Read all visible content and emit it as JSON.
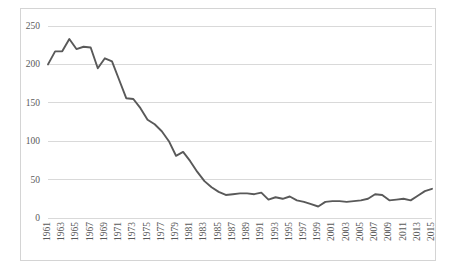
{
  "chart_data": {
    "type": "line",
    "title": "",
    "subtitle": "",
    "xlabel": "",
    "ylabel": "",
    "xlim": [
      1961,
      2015
    ],
    "ylim": [
      0,
      250
    ],
    "ytick_values": [
      250,
      200,
      150,
      100,
      50,
      0
    ],
    "ytick_labels": [
      "250",
      "200",
      "150",
      "100",
      "50",
      "0"
    ],
    "xtick_labels": [
      "1961",
      "1963",
      "1965",
      "1967",
      "1969",
      "1971",
      "1973",
      "1975",
      "1977",
      "1979",
      "1981",
      "1983",
      "1985",
      "1987",
      "1989",
      "1991",
      "1993",
      "1995",
      "1997",
      "1999",
      "2001",
      "2003",
      "2005",
      "2007",
      "2009",
      "2011",
      "2013",
      "2015"
    ],
    "grid": "horizontal",
    "legend": "none",
    "line_color": "#595959",
    "grid_color": "#d9d9d9",
    "axis_text_color": "#595959",
    "border_color": "#d4d4d4",
    "x": [
      1961,
      1962,
      1963,
      1964,
      1965,
      1966,
      1967,
      1968,
      1969,
      1970,
      1971,
      1972,
      1973,
      1974,
      1975,
      1976,
      1977,
      1978,
      1979,
      1980,
      1981,
      1982,
      1983,
      1984,
      1985,
      1986,
      1987,
      1988,
      1989,
      1990,
      1991,
      1992,
      1993,
      1994,
      1995,
      1996,
      1997,
      1998,
      1999,
      2000,
      2001,
      2002,
      2003,
      2004,
      2005,
      2006,
      2007,
      2008,
      2009,
      2010,
      2011,
      2012,
      2013,
      2014,
      2015
    ],
    "values": [
      200,
      217,
      217,
      233,
      220,
      223,
      222,
      195,
      208,
      204,
      180,
      156,
      155,
      143,
      128,
      122,
      113,
      100,
      81,
      86,
      74,
      60,
      48,
      40,
      34,
      30,
      31,
      32,
      32,
      31,
      33,
      24,
      27,
      25,
      28,
      23,
      21,
      18,
      15,
      21,
      22,
      22,
      21,
      22,
      23,
      25,
      31,
      30,
      23,
      24,
      25,
      23,
      29,
      35,
      38
    ],
    "series": [
      {
        "name": "Series 1",
        "values": [
          200,
          217,
          217,
          233,
          220,
          223,
          222,
          195,
          208,
          204,
          180,
          156,
          155,
          143,
          128,
          122,
          113,
          100,
          81,
          86,
          74,
          60,
          48,
          40,
          34,
          30,
          31,
          32,
          32,
          31,
          33,
          24,
          27,
          25,
          28,
          23,
          21,
          18,
          15,
          21,
          22,
          22,
          21,
          22,
          23,
          25,
          31,
          30,
          23,
          24,
          25,
          23,
          29,
          35,
          38
        ]
      }
    ]
  }
}
